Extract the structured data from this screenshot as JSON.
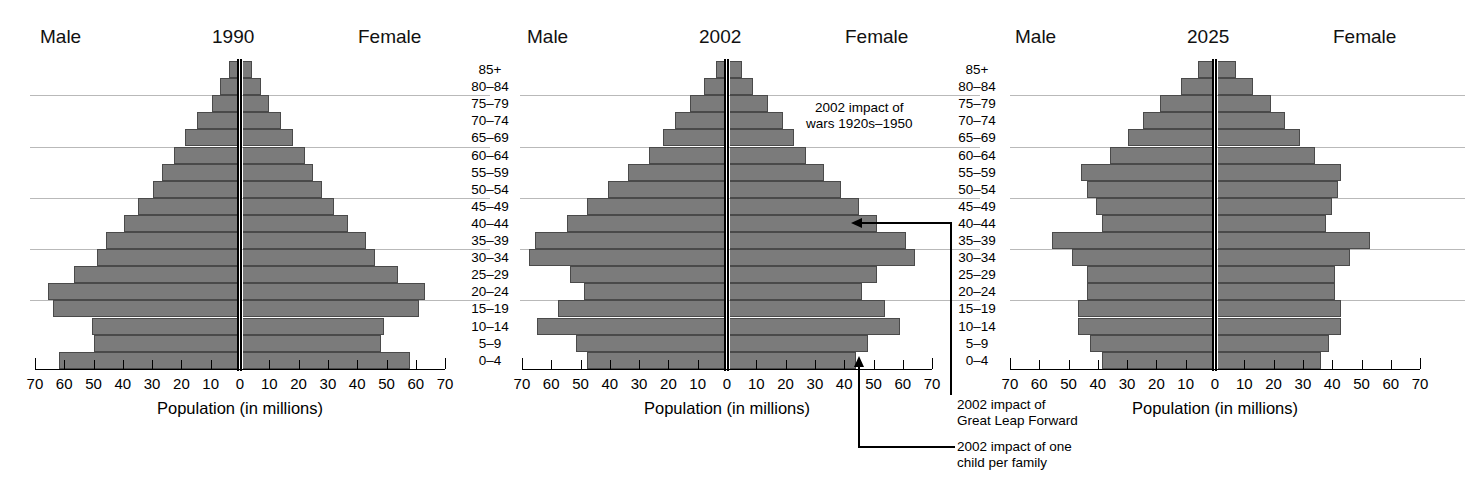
{
  "figure": {
    "axis_title": "Population (in millions)",
    "male_label": "Male",
    "female_label": "Female",
    "tick_labels": [
      "70",
      "60",
      "50",
      "40",
      "30",
      "20",
      "10",
      "0",
      "10",
      "20",
      "30",
      "40",
      "50",
      "60",
      "70"
    ]
  },
  "age_groups": [
    "85+",
    "80–84",
    "75–79",
    "70–74",
    "65–69",
    "60–64",
    "55–59",
    "50–54",
    "45–49",
    "40–44",
    "35–39",
    "30–34",
    "25–29",
    "20–24",
    "15–19",
    "10–14",
    "5–9",
    "0–4"
  ],
  "annotations": {
    "wars_line1": "2002 impact of",
    "wars_line2": "wars 1920s–1950",
    "glf_line1": "2002 impact of",
    "glf_line2": "Great Leap Forward",
    "onechild_line1": "2002 impact of one",
    "onechild_line2": "child per family"
  },
  "colors": {
    "bar_fill": "#7b7b7b",
    "bar_edge": "#4a4a4a",
    "axis": "#000000",
    "rule": "#b9b9b9"
  },
  "chart_data": [
    {
      "type": "bar",
      "title": "1990",
      "subtype": "population-pyramid",
      "xlabel": "Population (in millions)",
      "ylabel": "",
      "xlim": [
        -70,
        70
      ],
      "xticks": [
        -70,
        -60,
        -50,
        -40,
        -30,
        -20,
        -10,
        0,
        10,
        20,
        30,
        40,
        50,
        60,
        70
      ],
      "xticklabels": [
        "70",
        "60",
        "50",
        "40",
        "30",
        "20",
        "10",
        "0",
        "10",
        "20",
        "30",
        "40",
        "50",
        "60",
        "70"
      ],
      "grid": "horizontal-rules-at-75-79,60-64,45-49,30-34,15-19",
      "legend": "none",
      "categories": [
        "85+",
        "80–84",
        "75–79",
        "70–74",
        "65–69",
        "60–64",
        "55–59",
        "50–54",
        "45–49",
        "40–44",
        "35–39",
        "30–34",
        "25–29",
        "20–24",
        "15–19",
        "10–14",
        "5–9",
        "0–4"
      ],
      "series": [
        {
          "name": "Male",
          "values": [
            3,
            6,
            9,
            14,
            18,
            22,
            26,
            29,
            34,
            39,
            45,
            48,
            56,
            65,
            63,
            50,
            49,
            61
          ]
        },
        {
          "name": "Female",
          "values": [
            3,
            6,
            9,
            13,
            17,
            21,
            24,
            27,
            31,
            36,
            42,
            45,
            53,
            62,
            60,
            48,
            47,
            57
          ]
        }
      ]
    },
    {
      "type": "bar",
      "title": "2002",
      "subtype": "population-pyramid",
      "xlabel": "Population (in millions)",
      "ylabel": "",
      "xlim": [
        -70,
        70
      ],
      "xticks": [
        -70,
        -60,
        -50,
        -40,
        -30,
        -20,
        -10,
        0,
        10,
        20,
        30,
        40,
        50,
        60,
        70
      ],
      "xticklabels": [
        "70",
        "60",
        "50",
        "40",
        "30",
        "20",
        "10",
        "0",
        "10",
        "20",
        "30",
        "40",
        "50",
        "60",
        "70"
      ],
      "grid": "horizontal-rules-at-75-79,60-64,45-49,30-34,15-19",
      "legend": "none",
      "categories": [
        "85+",
        "80–84",
        "75–79",
        "70–74",
        "65–69",
        "60–64",
        "55–59",
        "50–54",
        "45–49",
        "40–44",
        "35–39",
        "30–34",
        "25–29",
        "20–24",
        "15–19",
        "10–14",
        "5–9",
        "0–4"
      ],
      "series": [
        {
          "name": "Male",
          "values": [
            3,
            7,
            12,
            17,
            21,
            26,
            33,
            40,
            47,
            54,
            65,
            67,
            53,
            48,
            57,
            64,
            51,
            47
          ]
        },
        {
          "name": "Female",
          "values": [
            4,
            8,
            13,
            18,
            22,
            26,
            32,
            38,
            44,
            50,
            60,
            63,
            50,
            45,
            53,
            58,
            47,
            43
          ]
        }
      ],
      "annotations": [
        {
          "text": "2002 impact of wars 1920s–1950",
          "points_to": "70–74 / 75–79"
        },
        {
          "text": "2002 impact of Great Leap Forward",
          "points_to": "40–44 female"
        },
        {
          "text": "2002 impact of one child per family",
          "points_to": "0–4 female"
        }
      ]
    },
    {
      "type": "bar",
      "title": "2025",
      "subtype": "population-pyramid",
      "xlabel": "Population (in millions)",
      "ylabel": "",
      "xlim": [
        -70,
        70
      ],
      "xticks": [
        -70,
        -60,
        -50,
        -40,
        -30,
        -20,
        -10,
        0,
        10,
        20,
        30,
        40,
        50,
        60,
        70
      ],
      "xticklabels": [
        "70",
        "60",
        "50",
        "40",
        "30",
        "20",
        "10",
        "0",
        "10",
        "20",
        "30",
        "40",
        "50",
        "60",
        "70"
      ],
      "grid": "horizontal-rules-at-75-79,60-64,45-49,30-34,15-19",
      "legend": "none",
      "categories": [
        "85+",
        "80–84",
        "75–79",
        "70–74",
        "65–69",
        "60–64",
        "55–59",
        "50–54",
        "45–49",
        "40–44",
        "35–39",
        "30–34",
        "25–29",
        "20–24",
        "15–19",
        "10–14",
        "5–9",
        "0–4"
      ],
      "series": [
        {
          "name": "Male",
          "values": [
            5,
            11,
            18,
            24,
            29,
            35,
            45,
            43,
            40,
            38,
            55,
            48,
            43,
            43,
            46,
            46,
            42,
            38
          ]
        },
        {
          "name": "Female",
          "values": [
            6,
            12,
            18,
            23,
            28,
            33,
            42,
            41,
            39,
            37,
            52,
            45,
            40,
            40,
            42,
            42,
            38,
            35
          ]
        }
      ]
    }
  ]
}
